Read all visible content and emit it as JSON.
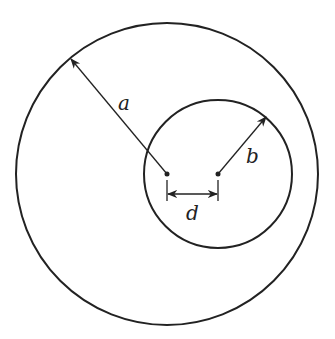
{
  "diagram": {
    "type": "eccentric-circles",
    "outer_circle": {
      "cx": 167,
      "cy": 174,
      "r": 151,
      "label": "a"
    },
    "inner_circle": {
      "cx": 218,
      "cy": 174,
      "r": 74,
      "label": "b"
    },
    "offset": {
      "label": "d"
    },
    "stroke_color": "#222222",
    "background": "#ffffff"
  }
}
